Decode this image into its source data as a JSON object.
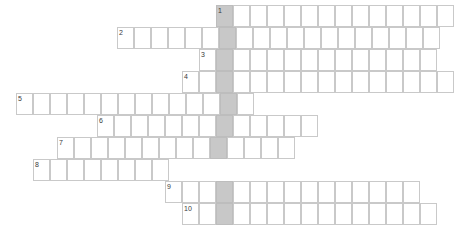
{
  "puzzle": {
    "type": "crossword-grid",
    "title": "Crossword puzzle grid",
    "geometry": {
      "cell_width": 17,
      "cell_height": 22,
      "origin_x": 16,
      "origin_y": 5,
      "canvas_width": 472,
      "canvas_height": 231
    },
    "colors": {
      "cell_background": "#ffffff",
      "cell_border": "#c9c9c9",
      "shaded_cell_background": "#c8c8c8",
      "number_text": "#3a3a3a",
      "page_background": "#ffffff"
    },
    "highlight_column": {
      "name": "solution-column",
      "x": 216,
      "y_start": 5,
      "y_end": 225,
      "cells": 10
    },
    "entries": [
      {
        "number": "1",
        "row": 0,
        "x": 216,
        "y": 5,
        "cells": 14,
        "shaded_index": 0
      },
      {
        "number": "2",
        "row": 1,
        "x": 117,
        "y": 27,
        "cells": 19,
        "shaded_index": 6
      },
      {
        "number": "3",
        "row": 2,
        "x": 199,
        "y": 49,
        "cells": 14,
        "shaded_index": 1
      },
      {
        "number": "4",
        "row": 3,
        "x": 182,
        "y": 71,
        "cells": 16,
        "shaded_index": 2
      },
      {
        "number": "5",
        "row": 4,
        "x": 16,
        "y": 93,
        "cells": 14,
        "shaded_index": 12
      },
      {
        "number": "6",
        "row": 5,
        "x": 97,
        "y": 115,
        "cells": 13,
        "shaded_index": 7
      },
      {
        "number": "7",
        "row": 6,
        "x": 57,
        "y": 137,
        "cells": 14,
        "shaded_index": 9
      },
      {
        "number": "8",
        "row": 7,
        "x": 33,
        "y": 159,
        "cells": 8,
        "shaded_index": 11
      },
      {
        "number": "9",
        "row": 8,
        "x": 165,
        "y": 181,
        "cells": 15,
        "shaded_index": 3
      },
      {
        "number": "10",
        "row": 9,
        "x": 182,
        "y": 203,
        "cells": 15,
        "shaded_index": 2
      }
    ]
  }
}
